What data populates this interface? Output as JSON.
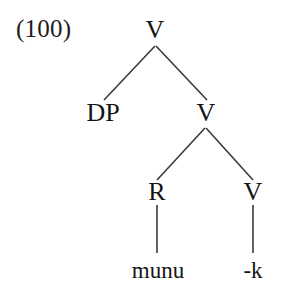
{
  "figure": {
    "example_number": "(100)",
    "background_color": "#ffffff",
    "line_color": "#3a3a3a",
    "text_color": "#141414",
    "type": "syntax-tree",
    "width": 282,
    "height": 288
  },
  "tree": {
    "nodes": [
      {
        "id": "root-v",
        "label": "V",
        "x": 155,
        "y": 30,
        "kind": "nonterminal"
      },
      {
        "id": "dp",
        "label": "DP",
        "x": 103,
        "y": 113,
        "kind": "nonterminal"
      },
      {
        "id": "mid-v",
        "label": "V",
        "x": 206,
        "y": 113,
        "kind": "nonterminal"
      },
      {
        "id": "r",
        "label": "R",
        "x": 157,
        "y": 192,
        "kind": "nonterminal"
      },
      {
        "id": "low-v",
        "label": "V",
        "x": 253,
        "y": 192,
        "kind": "nonterminal"
      },
      {
        "id": "munu",
        "label": "munu",
        "x": 158,
        "y": 270,
        "kind": "terminal"
      },
      {
        "id": "k-suffix",
        "label": "-k",
        "x": 253,
        "y": 270,
        "kind": "terminal"
      }
    ],
    "edges": [
      {
        "id": "edge-root-dp",
        "from": "root-v",
        "to": "dp",
        "x1": 155,
        "y1": 46,
        "x2": 104,
        "y2": 100
      },
      {
        "id": "edge-root-midv",
        "from": "root-v",
        "to": "mid-v",
        "x1": 156,
        "y1": 46,
        "x2": 207,
        "y2": 100
      },
      {
        "id": "edge-midv-r",
        "from": "mid-v",
        "to": "r",
        "x1": 205,
        "y1": 128,
        "x2": 157,
        "y2": 180
      },
      {
        "id": "edge-midv-lowv",
        "from": "mid-v",
        "to": "low-v",
        "x1": 206,
        "y1": 128,
        "x2": 253,
        "y2": 180
      },
      {
        "id": "edge-r-munu",
        "from": "r",
        "to": "munu",
        "x1": 157,
        "y1": 205,
        "x2": 157,
        "y2": 253
      },
      {
        "id": "edge-lowv-k",
        "from": "low-v",
        "to": "k-suffix",
        "x1": 253,
        "y1": 205,
        "x2": 253,
        "y2": 253
      }
    ]
  }
}
